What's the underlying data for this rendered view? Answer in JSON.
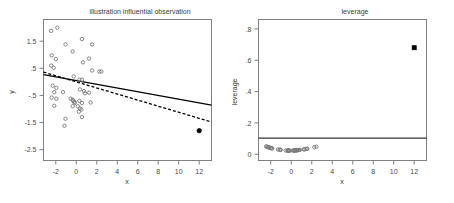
{
  "figure": {
    "background": "#ffffff",
    "width": 454,
    "height": 203,
    "panels": 2
  },
  "chart_data": [
    {
      "type": "scatter",
      "panel": "left",
      "title": "illustration influential observation",
      "xlabel": "x",
      "ylabel": "y",
      "xlim": [
        -3.2,
        13.2
      ],
      "ylim": [
        -2.9,
        2.3
      ],
      "xticks": [
        -2,
        0,
        2,
        4,
        6,
        8,
        10,
        12
      ],
      "xticklabels": [
        "-2",
        "0",
        "2",
        "4",
        "6",
        "8",
        "10",
        "12"
      ],
      "yticks": [
        1.5,
        0.5,
        -0.5,
        -1.5,
        -2.5
      ],
      "yticklabels": [
        "1.5",
        ".5",
        "-.5",
        "-1.5",
        "-2.5"
      ],
      "grid": false,
      "legend": "none",
      "series": [
        {
          "name": "observations",
          "marker": "open-circle",
          "color": "#7a7a7a",
          "points": [
            [
              -2.45,
              1.88
            ],
            [
              -1.85,
              2.0
            ],
            [
              -1.05,
              1.38
            ],
            [
              -0.35,
              1.12
            ],
            [
              0.55,
              1.58
            ],
            [
              1.55,
              1.38
            ],
            [
              -2.4,
              0.98
            ],
            [
              -2.0,
              0.84
            ],
            [
              1.25,
              0.86
            ],
            [
              -2.45,
              0.6
            ],
            [
              -2.2,
              0.52
            ],
            [
              0.65,
              0.72
            ],
            [
              1.55,
              0.42
            ],
            [
              2.25,
              0.38
            ],
            [
              2.45,
              0.38
            ],
            [
              -0.25,
              0.2
            ],
            [
              0.3,
              0.08
            ],
            [
              0.55,
              0.08
            ],
            [
              -2.3,
              -0.14
            ],
            [
              -1.95,
              -0.22
            ],
            [
              -2.15,
              -0.38
            ],
            [
              -1.3,
              -0.38
            ],
            [
              0.35,
              -0.28
            ],
            [
              0.75,
              -0.34
            ],
            [
              0.85,
              -0.42
            ],
            [
              1.25,
              -0.4
            ],
            [
              -2.4,
              -0.58
            ],
            [
              -1.95,
              -0.62
            ],
            [
              -0.55,
              -0.62
            ],
            [
              -0.35,
              -0.66
            ],
            [
              -0.3,
              -0.7
            ],
            [
              -0.2,
              -0.74
            ],
            [
              -0.15,
              -0.78
            ],
            [
              0.3,
              -0.7
            ],
            [
              0.55,
              -0.78
            ],
            [
              1.4,
              -0.76
            ],
            [
              -2.15,
              -0.88
            ],
            [
              -0.35,
              -0.9
            ],
            [
              0.15,
              -0.9
            ],
            [
              0.35,
              -0.98
            ],
            [
              0.5,
              -1.02
            ],
            [
              0.25,
              -1.1
            ],
            [
              -1.05,
              -1.36
            ],
            [
              0.55,
              -1.3
            ],
            [
              -1.15,
              -1.62
            ]
          ]
        },
        {
          "name": "influential observation",
          "marker": "filled-circle",
          "color": "#000000",
          "points": [
            [
              12.0,
              -1.8
            ]
          ]
        }
      ],
      "lines": [
        {
          "name": "fit-with-influential-point",
          "style": "solid",
          "color": "#000000",
          "from": [
            -3.2,
            0.27
          ],
          "to": [
            13.2,
            -0.86
          ]
        },
        {
          "name": "fit-without-influential-point",
          "style": "dashed",
          "color": "#000000",
          "from": [
            -3.2,
            0.36
          ],
          "to": [
            13.2,
            -1.48
          ]
        }
      ]
    },
    {
      "type": "scatter",
      "panel": "right",
      "title": "leverage",
      "xlabel": "x",
      "ylabel": "leverage",
      "xlim": [
        -3.2,
        13.2
      ],
      "ylim": [
        -0.04,
        0.86
      ],
      "xticks": [
        -2,
        0,
        2,
        4,
        6,
        8,
        10,
        12
      ],
      "xticklabels": [
        "-2",
        "0",
        "2",
        "4",
        "6",
        "8",
        "10",
        "12"
      ],
      "yticks": [
        0.8,
        0.6,
        0.4,
        0.2,
        0
      ],
      "yticklabels": [
        ".8",
        ".6",
        ".4",
        ".2",
        "0"
      ],
      "grid": false,
      "legend": "none",
      "series": [
        {
          "name": "leverage values",
          "marker": "open-circle",
          "color": "#7a7a7a",
          "points": [
            [
              -2.45,
              0.05
            ],
            [
              -2.4,
              0.048
            ],
            [
              -2.3,
              0.046
            ],
            [
              -2.2,
              0.044
            ],
            [
              -2.15,
              0.043
            ],
            [
              -2.15,
              0.043
            ],
            [
              -2.0,
              0.04
            ],
            [
              -1.95,
              0.039
            ],
            [
              -1.95,
              0.039
            ],
            [
              -1.85,
              0.037
            ],
            [
              -1.3,
              0.03
            ],
            [
              -1.15,
              0.029
            ],
            [
              -1.05,
              0.028
            ],
            [
              -1.05,
              0.028
            ],
            [
              -0.55,
              0.024
            ],
            [
              -0.35,
              0.023
            ],
            [
              -0.35,
              0.023
            ],
            [
              -0.35,
              0.023
            ],
            [
              -0.3,
              0.023
            ],
            [
              -0.25,
              0.023
            ],
            [
              -0.2,
              0.023
            ],
            [
              -0.15,
              0.023
            ],
            [
              0.15,
              0.023
            ],
            [
              0.25,
              0.024
            ],
            [
              0.3,
              0.024
            ],
            [
              0.3,
              0.024
            ],
            [
              0.35,
              0.024
            ],
            [
              0.35,
              0.024
            ],
            [
              0.5,
              0.025
            ],
            [
              0.55,
              0.025
            ],
            [
              0.55,
              0.026
            ],
            [
              0.55,
              0.026
            ],
            [
              0.65,
              0.026
            ],
            [
              0.75,
              0.027
            ],
            [
              0.85,
              0.028
            ],
            [
              1.25,
              0.031
            ],
            [
              1.25,
              0.031
            ],
            [
              1.4,
              0.033
            ],
            [
              1.55,
              0.035
            ],
            [
              1.55,
              0.035
            ],
            [
              2.25,
              0.045
            ],
            [
              2.45,
              0.048
            ]
          ]
        },
        {
          "name": "influential observation leverage",
          "marker": "filled-square",
          "color": "#000000",
          "points": [
            [
              12.0,
              0.68
            ]
          ]
        }
      ],
      "lines": [
        {
          "name": "leverage-cutoff",
          "style": "solid",
          "color": "#000000",
          "from": [
            -3.2,
            0.103
          ],
          "to": [
            13.2,
            0.103
          ]
        }
      ]
    }
  ]
}
